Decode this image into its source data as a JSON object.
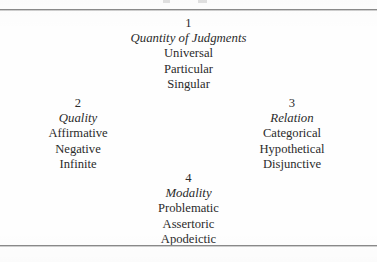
{
  "page": {
    "background_color": "#fefefe",
    "text_color": "#2b2b2b",
    "rule_color": "#8a8a8a"
  },
  "groups": [
    {
      "number": "1",
      "category": "Quantity of Judgments",
      "items": [
        "Universal",
        "Particular",
        "Singular"
      ]
    },
    {
      "number": "2",
      "category": "Quality",
      "items": [
        "Affirmative",
        "Negative",
        "Infinite"
      ]
    },
    {
      "number": "3",
      "category": "Relation",
      "items": [
        "Categorical",
        "Hypothetical",
        "Disjunctive"
      ]
    },
    {
      "number": "4",
      "category": "Modality",
      "items": [
        "Problematic",
        "Assertoric",
        "Apodeictic"
      ]
    }
  ]
}
